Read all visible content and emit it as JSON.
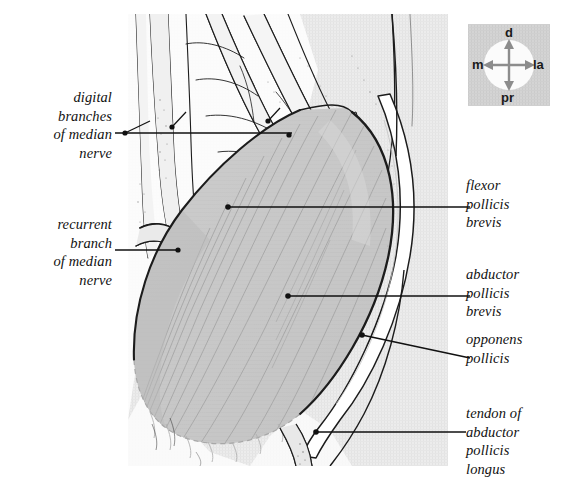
{
  "figure": {
    "type": "anatomical-illustration",
    "background_color": "#ffffff",
    "plate_tint": "#ebebeb",
    "muscle_fill": "#c9c9c9",
    "tendon_fill": "#ffffff",
    "ink_color": "#1a1a1a"
  },
  "labels": {
    "digital_branches": {
      "text": "digital\nbranches\nof median\nnerve",
      "side": "left"
    },
    "recurrent_branch": {
      "text": "recurrent\nbranch\nof median\nnerve",
      "side": "left"
    },
    "flexor_pollicis_brevis": {
      "text": "flexor\npollicis\nbrevis",
      "side": "right"
    },
    "abductor_pollicis_brevis": {
      "text": "abductor\npollicis\nbrevis",
      "side": "right"
    },
    "opponens_pollicis": {
      "text": "opponens\npollicis",
      "side": "right"
    },
    "tendon_abductor_pollicis_longus": {
      "text": "tendon of\nabductor\npollicis\nlongus",
      "side": "right"
    }
  },
  "compass": {
    "name": "orientation-compass",
    "distal": "d",
    "proximal": "pr",
    "medial": "m",
    "lateral": "la",
    "box_color": "#d2d2d2",
    "disc_color": "#fbfbfb",
    "arrow_color": "#8c8c8c"
  }
}
